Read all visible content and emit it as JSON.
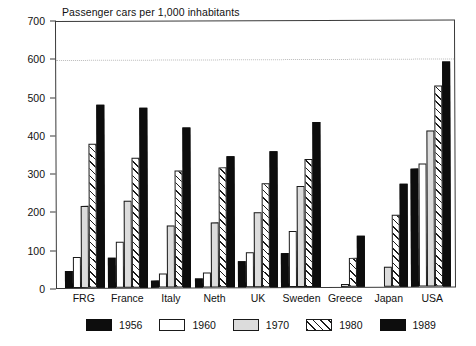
{
  "chart_data": {
    "type": "bar",
    "title": "Passenger cars per 1,000 inhabitants",
    "xlabel": "",
    "ylabel": "",
    "ylim": [
      0,
      700
    ],
    "ytick_labels": [
      "700",
      "600",
      "500",
      "400",
      "300",
      "200",
      "100",
      "0"
    ],
    "ytick_values": [
      700,
      600,
      500,
      400,
      300,
      200,
      100,
      0
    ],
    "grid": "dotted horizontal gridline at 600 only",
    "legend_position": "bottom-center",
    "categories": [
      "FRG",
      "France",
      "Italy",
      "Neth",
      "UK",
      "Sweden",
      "Greece",
      "Japan",
      "USA"
    ],
    "series": [
      {
        "name": "1956",
        "style": "solid-black",
        "color": "#0d0d0d",
        "values": [
          44,
          78,
          18,
          23,
          68,
          90,
          null,
          null,
          307
        ]
      },
      {
        "name": "1960",
        "style": "white-outline",
        "color": "#ffffff",
        "values": [
          82,
          119,
          36,
          39,
          91,
          147,
          null,
          null,
          321
        ]
      },
      {
        "name": "1970",
        "style": "light-gray",
        "color": "#dcdcdc",
        "values": [
          214,
          228,
          162,
          171,
          197,
          265,
          9,
          52,
          407
        ]
      },
      {
        "name": "1980",
        "style": "diagonal-hatch",
        "color": "#ffffff",
        "values": [
          375,
          339,
          305,
          314,
          271,
          334,
          76,
          188,
          525
        ]
      },
      {
        "name": "1989",
        "style": "solid-black",
        "color": "#0d0d0d",
        "values": [
          477,
          470,
          417,
          341,
          355,
          431,
          134,
          269,
          587
        ]
      }
    ]
  },
  "legend": {
    "items": [
      {
        "label": "1956",
        "swatch": "solid-black-swatch"
      },
      {
        "label": "1960",
        "swatch": "white-outline-swatch"
      },
      {
        "label": "1970",
        "swatch": "light-gray-swatch"
      },
      {
        "label": "1980",
        "swatch": "diagonal-hatch-swatch"
      },
      {
        "label": "1989",
        "swatch": "solid-black-swatch"
      }
    ]
  }
}
